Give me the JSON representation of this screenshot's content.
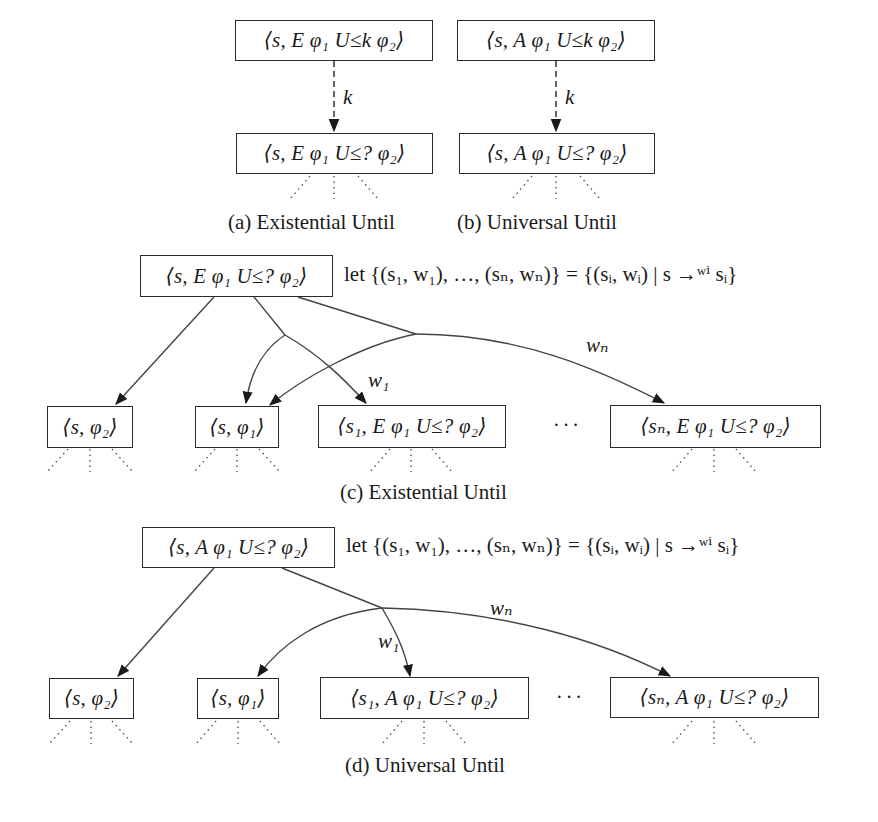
{
  "figure": {
    "panel_a": {
      "top_node": "⟨s, E φ₁ U≤k φ₂⟩",
      "bottom_node": "⟨s, E φ₁ U≤? φ₂⟩",
      "edge_label": "k",
      "caption": "(a) Existential Until"
    },
    "panel_b": {
      "top_node": "⟨s, A φ₁ U≤k φ₂⟩",
      "bottom_node": "⟨s, A φ₁ U≤? φ₂⟩",
      "edge_label": "k",
      "caption": "(b) Universal Until"
    },
    "panel_c": {
      "root_node": "⟨s, E φ₁ U≤? φ₂⟩",
      "let_expression": "let {(s₁, w₁), …, (sₙ, wₙ)} = {(sᵢ, wᵢ) | s →ʷⁱ sᵢ}",
      "children": [
        "⟨s, φ₂⟩",
        "⟨s, φ₁⟩",
        "⟨s₁, E φ₁ U≤? φ₂⟩",
        "⟨sₙ, E φ₁ U≤? φ₂⟩"
      ],
      "ellipsis": "···",
      "edge_labels": {
        "w1": "w₁",
        "wn": "wₙ"
      },
      "caption": "(c) Existential Until"
    },
    "panel_d": {
      "root_node": "⟨s, A φ₁ U≤? φ₂⟩",
      "let_expression": "let {(s₁, w₁), …, (sₙ, wₙ)} = {(sᵢ, wᵢ) | s →ʷⁱ sᵢ}",
      "children": [
        "⟨s, φ₂⟩",
        "⟨s, φ₁⟩",
        "⟨s₁, A φ₁ U≤? φ₂⟩",
        "⟨sₙ, A φ₁ U≤? φ₂⟩"
      ],
      "ellipsis": "···",
      "edge_labels": {
        "w1": "w₁",
        "wn": "wₙ"
      },
      "caption": "(d) Universal Until"
    }
  }
}
